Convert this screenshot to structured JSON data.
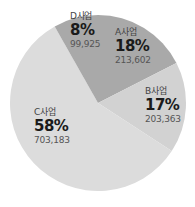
{
  "chart_data": {
    "type": "pie",
    "title": "",
    "start_angle_deg": 0,
    "direction": "clockwise",
    "slices": [
      {
        "key": "A",
        "label": "A사업",
        "percent": "18%",
        "value": "213,602",
        "raw": 213602,
        "color": "#a9a9a9"
      },
      {
        "key": "B",
        "label": "B사업",
        "percent": "17%",
        "value": "203,363",
        "raw": 203363,
        "color": "#d2d2d2"
      },
      {
        "key": "C",
        "label": "C사업",
        "percent": "58%",
        "value": "703,183",
        "raw": 703183,
        "color": "#dcdcdc"
      },
      {
        "key": "D",
        "label": "D사업",
        "percent": "8%",
        "value": "99,925",
        "raw": 99925,
        "color": "#a9a9a9"
      }
    ],
    "legend": "none"
  }
}
